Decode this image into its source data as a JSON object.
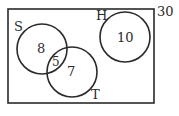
{
  "diagram": {
    "type": "venn",
    "universe": {
      "label": "30"
    },
    "sets": [
      {
        "name": "S",
        "label": "S",
        "only_value": "8"
      },
      {
        "name": "T",
        "label": "T",
        "only_value": "7"
      },
      {
        "name": "H",
        "label": "H",
        "only_value": "10"
      }
    ],
    "intersections": [
      {
        "sets": [
          "S",
          "T"
        ],
        "value": "5"
      }
    ],
    "colors": {
      "stroke": "#2a2a2a",
      "background": "#ffffff"
    }
  }
}
